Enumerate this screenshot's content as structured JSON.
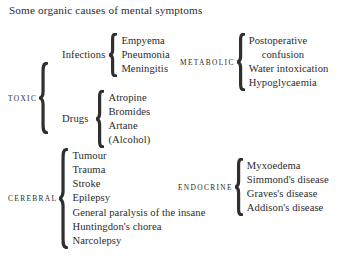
{
  "title": "Some organic causes of mental symptoms",
  "colors": {
    "background": "#ffffff",
    "text": "#2b2b2b",
    "brace": "#2f2f2f"
  },
  "branches": [
    {
      "id": "toxic",
      "label": "TOXIC",
      "subgroups": [
        {
          "id": "infections",
          "label": "Infections",
          "items": [
            "Empyema",
            "Pneumonia",
            "Meningitis"
          ]
        },
        {
          "id": "drugs",
          "label": "Drugs",
          "items": [
            "Atropine",
            "Bromides",
            "Artane",
            "(Alcohol)"
          ]
        }
      ]
    },
    {
      "id": "metabolic",
      "label": "METABOLIC",
      "items": [
        "Postoperative",
        "confusion",
        "Water intoxication",
        "Hypoglycaemia"
      ]
    },
    {
      "id": "cerebral",
      "label": "CEREBRAL",
      "items": [
        "Tumour",
        "Trauma",
        "Stroke",
        "Epilepsy",
        "General paralysis of the insane",
        "Huntingdon's chorea",
        "Narcolepsy"
      ]
    },
    {
      "id": "endocrine",
      "label": "ENDOCRINE",
      "items": [
        "Myxoedema",
        "Simmond's disease",
        "Graves's disease",
        "Addison's disease"
      ]
    }
  ]
}
